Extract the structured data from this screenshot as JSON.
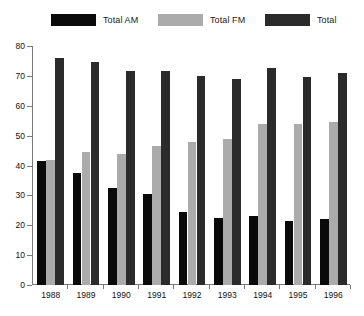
{
  "legend": {
    "items": [
      {
        "label": "Total AM",
        "color": "#0a0a0a",
        "swatch_name": "legend-swatch-total-am"
      },
      {
        "label": "Total FM",
        "color": "#ababab",
        "swatch_name": "legend-swatch-total-fm"
      },
      {
        "label": "Total",
        "color": "#2b2b2b",
        "swatch_name": "legend-swatch-total"
      }
    ]
  },
  "chart_data": {
    "type": "bar",
    "title": "",
    "subtitle": "",
    "xlabel": "",
    "ylabel": "",
    "categories": [
      "1988",
      "1989",
      "1990",
      "1991",
      "1992",
      "1993",
      "1994",
      "1995",
      "1996"
    ],
    "series": [
      {
        "name": "Total AM",
        "color": "#0a0a0a",
        "values": [
          41.5,
          37.5,
          32.5,
          30.5,
          24.5,
          22.5,
          23,
          21.5,
          22
        ]
      },
      {
        "name": "Total FM",
        "color": "#ababab",
        "values": [
          42,
          44.5,
          44,
          46.5,
          48,
          49,
          54,
          54,
          54.5
        ]
      },
      {
        "name": "Total",
        "color": "#2b2b2b",
        "values": [
          76,
          74.5,
          71.5,
          71.5,
          70,
          69,
          72.5,
          69.5,
          71
        ]
      }
    ],
    "ylim": [
      0,
      80
    ],
    "ytick_step": 10,
    "yticks": [
      0,
      10,
      20,
      30,
      40,
      50,
      60,
      70,
      80
    ],
    "grid": false,
    "legend_position": "top"
  },
  "axes": {
    "axis_color": "#7a7a7a",
    "background": "#ffffff"
  }
}
